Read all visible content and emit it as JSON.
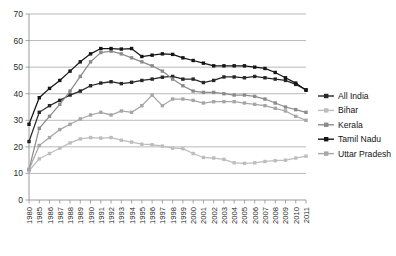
{
  "chart_data": {
    "type": "line",
    "title": "",
    "xlabel": "",
    "ylabel": "",
    "ylim": [
      0,
      70
    ],
    "yticks": [
      0,
      10,
      20,
      30,
      40,
      50,
      60,
      70
    ],
    "grid": true,
    "legend_position": "right",
    "marker": "square",
    "categories": [
      "1980",
      "1985",
      "1986",
      "1987",
      "1988",
      "1989",
      "1990",
      "1991",
      "1992",
      "1993",
      "1994",
      "1995",
      "1996",
      "1997",
      "1998",
      "1999",
      "2000",
      "2001",
      "2002",
      "2003",
      "2004",
      "2005",
      "2006",
      "2007",
      "2008",
      "2009",
      "2010",
      "2011"
    ],
    "series": [
      {
        "name": "All India",
        "color": "#262626",
        "values": [
          22.0,
          33.0,
          35.5,
          37.5,
          39.5,
          41.0,
          43.0,
          44.0,
          44.5,
          43.8,
          44.3,
          45.0,
          45.5,
          46.2,
          46.5,
          45.5,
          45.5,
          44.2,
          45.0,
          46.3,
          46.3,
          46.0,
          46.5,
          46.0,
          45.5,
          45.0,
          43.5,
          41.5
        ]
      },
      {
        "name": "Bihar",
        "color": "#bdbdbd",
        "values": [
          11.0,
          15.5,
          17.5,
          19.5,
          21.5,
          23.0,
          23.5,
          23.3,
          23.5,
          22.5,
          21.8,
          21.0,
          20.8,
          20.3,
          19.5,
          19.3,
          17.5,
          16.0,
          15.8,
          15.3,
          14.0,
          13.8,
          14.0,
          14.5,
          14.8,
          15.0,
          15.8,
          16.5
        ]
      },
      {
        "name": "Kerala",
        "color": "#8c8c8c",
        "values": [
          11.5,
          27.0,
          31.5,
          36.0,
          41.0,
          46.5,
          52.0,
          55.5,
          56.0,
          55.0,
          53.5,
          52.0,
          50.5,
          48.5,
          45.5,
          43.0,
          41.0,
          40.5,
          40.5,
          40.0,
          39.5,
          39.5,
          39.0,
          38.0,
          36.5,
          35.0,
          34.0,
          33.0
        ]
      },
      {
        "name": "Tamil Nadu",
        "color": "#151515",
        "values": [
          28.5,
          38.5,
          42.0,
          45.0,
          48.5,
          52.0,
          55.0,
          57.0,
          57.0,
          56.8,
          57.0,
          54.0,
          54.5,
          55.0,
          54.8,
          53.5,
          52.5,
          51.5,
          50.5,
          50.5,
          50.5,
          50.5,
          50.0,
          49.5,
          48.0,
          46.0,
          44.0,
          41.3
        ]
      },
      {
        "name": "Uttar Pradesh",
        "color": "#a6a6a6",
        "values": [
          11.5,
          20.5,
          23.5,
          26.5,
          28.5,
          30.5,
          32.0,
          33.0,
          32.0,
          33.5,
          33.0,
          35.5,
          39.5,
          35.5,
          38.0,
          38.0,
          37.5,
          36.5,
          37.0,
          37.0,
          37.0,
          36.5,
          36.0,
          35.5,
          34.5,
          33.5,
          31.5,
          30.0
        ]
      }
    ]
  },
  "axis": {
    "ytick_labels": [
      "0",
      "10",
      "20",
      "30",
      "40",
      "50",
      "60",
      "70"
    ]
  },
  "legend": {
    "entries": [
      {
        "label": "All India"
      },
      {
        "label": "Bihar"
      },
      {
        "label": "Kerala"
      },
      {
        "label": "Tamil Nadu"
      },
      {
        "label": "Uttar Pradesh"
      }
    ]
  }
}
